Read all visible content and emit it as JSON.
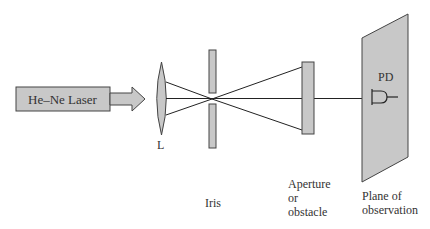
{
  "diagram": {
    "colors": {
      "fill": "#c8c8c8",
      "stroke": "#333333",
      "background": "#ffffff"
    },
    "components": {
      "laser": {
        "label": "He–Ne Laser"
      },
      "lens": {
        "label": "L"
      },
      "iris": {
        "label": "Iris"
      },
      "aperture": {
        "label_line1": "Aperture",
        "label_line2": "or",
        "label_line3": "obstacle"
      },
      "plane": {
        "label_line1": "Plane of",
        "label_line2": "observation"
      },
      "photodetector": {
        "label": "PD"
      }
    }
  }
}
